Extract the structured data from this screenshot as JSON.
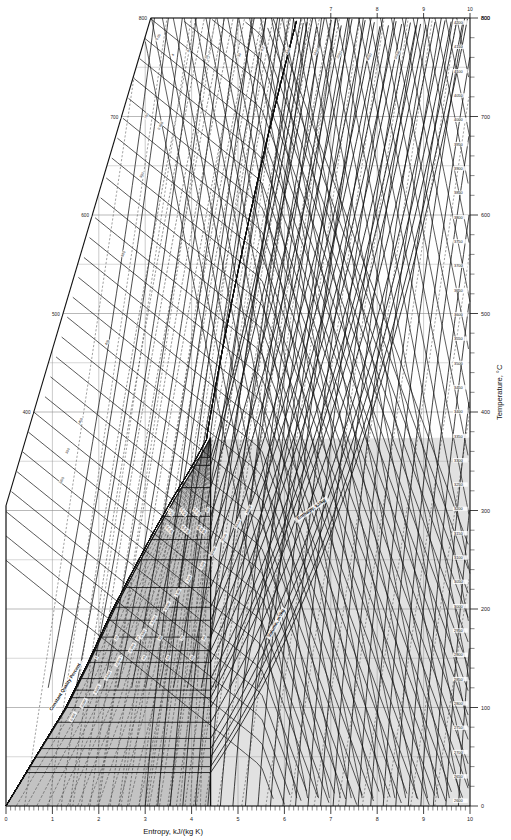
{
  "chart_data": {
    "type": "line",
    "xlabel": "Entropy, kJ/(kg K)",
    "ylabel": "Temperature, °C",
    "xlim": [
      0,
      10
    ],
    "ylim": [
      0,
      800
    ],
    "grid": true,
    "legend": "none",
    "x_ticks": [
      0,
      1,
      2,
      3,
      4,
      5,
      6,
      7,
      8,
      9,
      10
    ],
    "x_tick_labels": [
      "0",
      "1",
      "2",
      "3",
      "4",
      "5",
      "6",
      "7",
      "8",
      "9",
      "10"
    ],
    "x_minor_step": 0.1,
    "y_ticks": [
      0,
      100,
      200,
      300,
      400,
      500,
      600,
      700,
      800
    ],
    "y_tick_labels": [
      "0",
      "100",
      "200",
      "300",
      "400",
      "500",
      "600",
      "700",
      "800"
    ],
    "y_minor_step": 20,
    "top_axis_ticks": [
      "7",
      "8",
      "9",
      "10"
    ],
    "top_axis_left_label": "800",
    "top_axis_right_label": "800",
    "series_families": [
      {
        "name": "saturation-dome",
        "kind": "boundary",
        "description": "Saturated liquid and saturated vapour boundary, critical point at top",
        "critical_point": {
          "s": 4.41,
          "T": 374.0
        },
        "saturated_liquid_s": [
          0.0,
          0.65,
          1.31,
          1.84,
          2.34,
          2.79,
          3.25,
          3.68,
          4.01,
          4.41
        ],
        "saturated_liquid_T": [
          0,
          50,
          100,
          150,
          200,
          240,
          280,
          315,
          340,
          374
        ],
        "saturated_vapour_s": [
          9.16,
          8.67,
          8.07,
          7.59,
          7.13,
          6.83,
          6.51,
          6.19,
          5.9,
          4.41
        ],
        "saturated_vapour_T": [
          0,
          40,
          100,
          150,
          200,
          240,
          280,
          315,
          340,
          374
        ],
        "shaded": true,
        "shade_color": "#b8b8b8"
      },
      {
        "name": "isobars",
        "kind": "constant pressure",
        "unit": "bar",
        "labels": [
          "0.01",
          "0.02",
          "0.05",
          "0.1",
          "0.2",
          "0.5",
          "1",
          "1.5",
          "2",
          "3",
          "5",
          "7",
          "10",
          "15",
          "20",
          "30",
          "50",
          "70",
          "100",
          "150",
          "200",
          "221",
          "250",
          "300",
          "400",
          "500",
          "600",
          "800",
          "1000"
        ]
      },
      {
        "name": "isenthalps",
        "kind": "constant enthalpy",
        "unit": "kJ/kg",
        "labels": [
          "2600",
          "2650",
          "2700",
          "2750",
          "2800",
          "2850",
          "2900",
          "2950",
          "3000",
          "3050",
          "3100",
          "3150",
          "3200",
          "3250",
          "3300",
          "3350",
          "3400",
          "3450",
          "3500",
          "3550",
          "3600",
          "3650",
          "3700",
          "3750",
          "3800",
          "3850",
          "3900",
          "3950",
          "4000",
          "4050",
          "4100",
          "4150",
          "4200"
        ]
      },
      {
        "name": "quality-lines",
        "kind": "constant quality",
        "unit": "percent",
        "annotation": "Constant Quality Percent",
        "labels": [
          "5",
          "10",
          "15",
          "20",
          "25",
          "30",
          "35",
          "40",
          "45",
          "50",
          "55",
          "60",
          "65",
          "70",
          "75",
          "80",
          "85",
          "90",
          "95"
        ]
      },
      {
        "name": "isochors",
        "kind": "constant volume",
        "unit": "m³/kg",
        "annotation": "Volume, m³/kg",
        "labels": [
          "0.001",
          "0.002",
          "0.005",
          "0.010",
          "0.020",
          "0.050",
          "0.100",
          "0.200",
          "0.500",
          "1.00",
          "2.00",
          "5.00",
          "10.00",
          "20.00",
          "50.00",
          "100.0"
        ]
      }
    ],
    "annotations": [
      {
        "text": "Constant Quality Percent",
        "s": 1.3,
        "T": 120,
        "rotation": -58
      },
      {
        "text": "Volume, m³/kg",
        "s": 5.85,
        "T": 185,
        "rotation": -62
      },
      {
        "text": "Enthalpy, kJ/kg",
        "s": 6.6,
        "T": 300,
        "rotation": -35
      }
    ],
    "left_edge_temp_labels": [
      "800",
      "700",
      "600",
      "500",
      "400",
      "300"
    ],
    "right_edge_enthalpy_labels": [
      "4200",
      "4150",
      "4100",
      "4050",
      "4000",
      "3950",
      "3900",
      "3850",
      "3800",
      "3750",
      "3700",
      "3650",
      "3600",
      "3550",
      "3500",
      "3450",
      "3400",
      "3350",
      "3300",
      "3250",
      "3200",
      "3150",
      "3100",
      "3050",
      "3000",
      "2950",
      "2900",
      "2850",
      "2800",
      "2750",
      "2700",
      "2650",
      "2600"
    ]
  },
  "axes": {
    "x_title": "Entropy, kJ/(kg K)",
    "y_title": "Temperature, °C"
  }
}
